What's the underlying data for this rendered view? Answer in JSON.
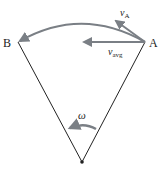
{
  "diagram": {
    "points": {
      "B": {
        "label": "B",
        "x": 18,
        "y": 42
      },
      "A": {
        "label": "A",
        "x": 145,
        "y": 42
      },
      "pivot": {
        "x": 82,
        "y": 162
      }
    },
    "vectors": {
      "v_A": {
        "symbol": "v",
        "subscript": "A"
      },
      "v_avg": {
        "symbol": "v",
        "subscript": "avg"
      }
    },
    "angular_velocity": {
      "symbol": "ω"
    },
    "colors": {
      "arrow": "#7a7f85",
      "line": "#222222",
      "text": "#222222"
    }
  }
}
